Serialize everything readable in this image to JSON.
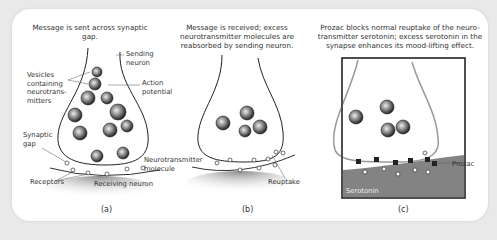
{
  "figure": {
    "panels": [
      {
        "id": "a",
        "label": "(a)",
        "caption": "Message is sent across synaptic gap.",
        "annotations": {
          "sending_neuron": "Sending neuron",
          "vesicles": "Vesicles containing neurotrans- mitters",
          "action_potential": "Action potential",
          "synaptic_gap": "Synaptic gap",
          "neurotransmitter_molecule": "Neurotransmitter molecule",
          "receptors": "Receptors",
          "receiving_neuron": "Receiving neuron"
        }
      },
      {
        "id": "b",
        "label": "(b)",
        "caption": "Message is received; excess neurotransmitter molecules are reabsorbed by sending neuron.",
        "annotations": {
          "reuptake": "Reuptake"
        }
      },
      {
        "id": "c",
        "label": "(c)",
        "caption": "Prozac blocks normal reuptake of the neuro- transmitter serotonin; excess serotonin in the synapse enhances its mood-lifting effect.",
        "annotations": {
          "prozac": "Prozac",
          "serotonin": "Serotonin"
        }
      }
    ]
  }
}
